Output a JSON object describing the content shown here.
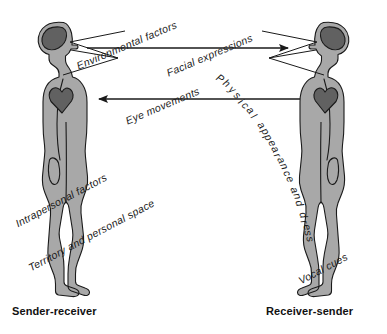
{
  "diagram": {
    "title_visible": false,
    "background_color": "#ffffff",
    "body_fill": "#a8a8a8",
    "organ_fill": "#616161",
    "outline_color": "#1a1a1a",
    "text_color": "#1a1a1a",
    "figures": [
      {
        "id": "left-figure",
        "role_label": "Sender-receiver",
        "facing": "right",
        "organs": [
          "brain",
          "heart"
        ]
      },
      {
        "id": "right-figure",
        "role_label": "Receiver-sender",
        "facing": "left",
        "organs": [
          "brain",
          "heart"
        ]
      }
    ],
    "arrows": [
      {
        "id": "arrow-left-to-right",
        "direction": "left-to-right",
        "labels": [
          "Environmental factors",
          "Facial expressions"
        ]
      },
      {
        "id": "arrow-right-to-left",
        "direction": "right-to-left",
        "labels": [
          "Eye movements",
          "Physical appearance and dress"
        ]
      }
    ],
    "labels": {
      "environmental_factors": "Environmental factors",
      "facial_expressions": "Facial expressions",
      "eye_movements": "Eye movements",
      "physical_appearance": "Physical appearance and dress",
      "intrapersonal_factors": "Intrapersonal factors",
      "territory_personal_space": "Territory and personal space",
      "vocal_cues": "Vocal cues"
    },
    "bottom_labels": {
      "left": "Sender-receiver",
      "right": "Receiver-sender"
    }
  }
}
